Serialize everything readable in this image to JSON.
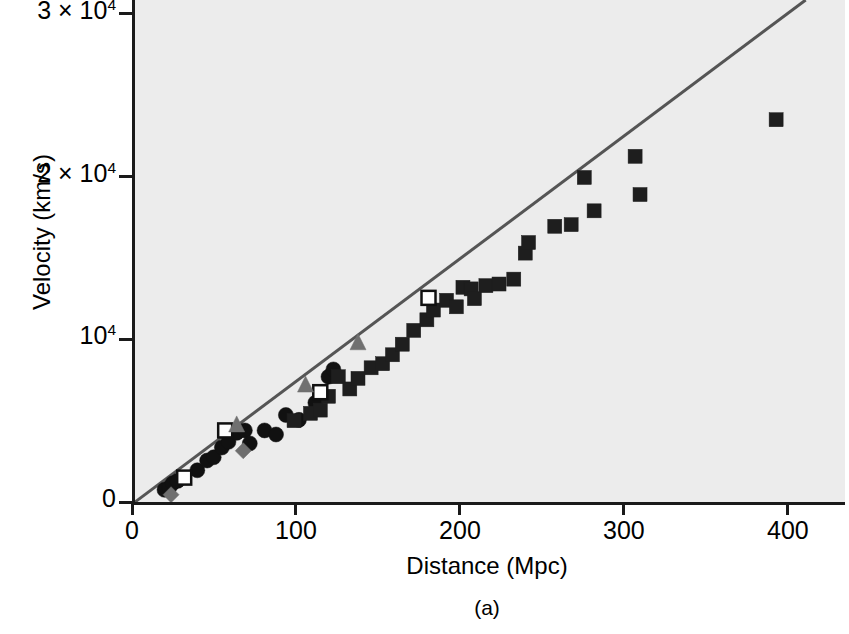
{
  "figure": {
    "caption": "(a)",
    "xlabel": "Distance (Mpc)",
    "ylabel": "Velocity (km/s)",
    "plot_bg": "#ececec",
    "axis_color": "#1a1a1a",
    "line_color": "#555555"
  },
  "axes": {
    "x_ticks": [
      {
        "value": 0,
        "label": "0"
      },
      {
        "value": 100,
        "label": "100"
      },
      {
        "value": 200,
        "label": "200"
      },
      {
        "value": 300,
        "label": "300"
      },
      {
        "value": 400,
        "label": "400"
      }
    ],
    "y_ticks": [
      {
        "value": 0,
        "label": "0",
        "mantissa": "0",
        "exponent": ""
      },
      {
        "value": 10000,
        "label": "10⁴",
        "mantissa": "10",
        "exponent": "4"
      },
      {
        "value": 20000,
        "label": "2 × 10⁴",
        "mantissa": "2 × 10",
        "exponent": "4"
      },
      {
        "value": 30000,
        "label": "3 × 10⁴",
        "mantissa": "3 × 10",
        "exponent": "4"
      }
    ]
  },
  "chart_data": {
    "type": "scatter",
    "title": "",
    "xlabel": "Distance (Mpc)",
    "ylabel": "Velocity (km/s)",
    "xlim": [
      0,
      433
    ],
    "ylim": [
      0,
      30860
    ],
    "grid": false,
    "legend": "none",
    "fit_line": {
      "label": "Hubble law fit",
      "color": "#555555",
      "slope_km_s_per_Mpc": 72.8,
      "intercept": 0,
      "x_start": 0,
      "y_start": 0,
      "x_end": 409,
      "y_end": 30860
    },
    "series": [
      {
        "name": "filled-circle",
        "marker": "circle",
        "fill": "#111111",
        "edge": "#111111",
        "size": 15,
        "points": [
          [
            18,
            750
          ],
          [
            21,
            900
          ],
          [
            23,
            1150
          ],
          [
            26,
            1300
          ],
          [
            38,
            1950
          ],
          [
            44,
            2550
          ],
          [
            48,
            2750
          ],
          [
            53,
            3350
          ],
          [
            57,
            3700
          ],
          [
            62,
            4250
          ],
          [
            67,
            4400
          ],
          [
            70,
            3600
          ],
          [
            79,
            4400
          ],
          [
            86,
            4150
          ],
          [
            92,
            5350
          ],
          [
            100,
            5050
          ],
          [
            110,
            6100
          ],
          [
            118,
            7700
          ],
          [
            121,
            8150
          ]
        ]
      },
      {
        "name": "filled-square",
        "marker": "square",
        "fill": "#1e1e1e",
        "edge": "#1e1e1e",
        "size": 14,
        "points": [
          [
            97,
            5000
          ],
          [
            107,
            5450
          ],
          [
            113,
            5650
          ],
          [
            118,
            6500
          ],
          [
            124,
            7700
          ],
          [
            131,
            6950
          ],
          [
            136,
            7600
          ],
          [
            144,
            8250
          ],
          [
            151,
            8500
          ],
          [
            157,
            9050
          ],
          [
            163,
            9700
          ],
          [
            170,
            10550
          ],
          [
            178,
            11200
          ],
          [
            182,
            11800
          ],
          [
            190,
            12400
          ],
          [
            196,
            12000
          ],
          [
            200,
            13200
          ],
          [
            205,
            13100
          ],
          [
            207,
            12500
          ],
          [
            214,
            13300
          ],
          [
            222,
            13400
          ],
          [
            231,
            13700
          ],
          [
            238,
            15300
          ],
          [
            240,
            15950
          ],
          [
            256,
            16950
          ],
          [
            266,
            17050
          ],
          [
            274,
            19950
          ],
          [
            280,
            17900
          ],
          [
            305,
            21250
          ],
          [
            308,
            18900
          ],
          [
            391,
            23500
          ]
        ]
      },
      {
        "name": "open-square",
        "marker": "square-open",
        "fill": "#ffffff",
        "edge": "#111111",
        "size": 14,
        "points": [
          [
            30,
            1500
          ],
          [
            55,
            4400
          ],
          [
            113,
            6750
          ],
          [
            179,
            12550
          ]
        ]
      },
      {
        "name": "gray-triangle",
        "marker": "triangle",
        "fill": "#707070",
        "edge": "#707070",
        "size": 16,
        "points": [
          [
            62,
            4800
          ],
          [
            104,
            7250
          ],
          [
            136,
            9850
          ]
        ]
      },
      {
        "name": "gray-diamond",
        "marker": "diamond",
        "fill": "#6e6e6e",
        "edge": "#6e6e6e",
        "size": 16,
        "points": [
          [
            22,
            450
          ],
          [
            66,
            3150
          ]
        ]
      }
    ]
  }
}
